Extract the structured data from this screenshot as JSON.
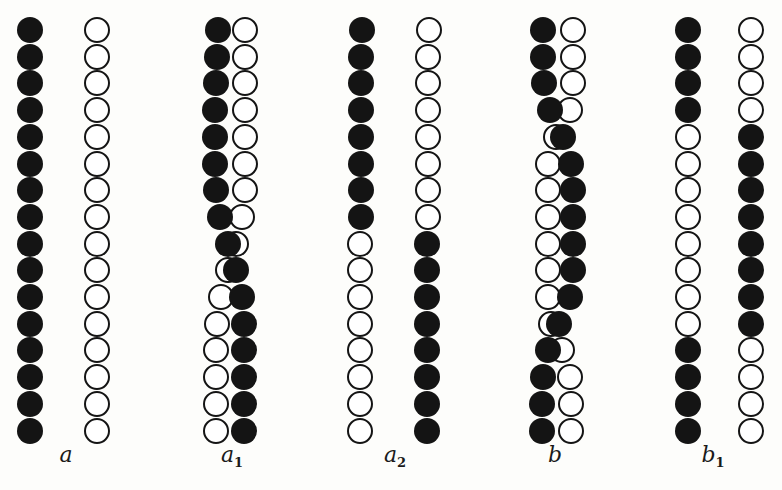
{
  "figure": {
    "background": "#fdfdfb",
    "ink": "#141414",
    "bead_radius": 13,
    "row_y_start": 30,
    "row_pitch": 26.7,
    "rows": 16,
    "label_y": 452,
    "panels": [
      {
        "id": "a",
        "label": "a",
        "subscript": "",
        "label_x": 66,
        "strands": [
          {
            "name": "left-strand",
            "x": [
              30,
              30,
              30,
              30,
              30,
              30,
              30,
              30,
              30,
              30,
              30,
              30,
              30,
              30,
              30,
              30
            ],
            "fill": [
              "F",
              "F",
              "F",
              "F",
              "F",
              "F",
              "F",
              "F",
              "F",
              "F",
              "F",
              "F",
              "F",
              "F",
              "F",
              "F"
            ]
          },
          {
            "name": "right-strand",
            "x": [
              97,
              97,
              97,
              97,
              97,
              97,
              97,
              97,
              97,
              97,
              97,
              97,
              97,
              97,
              97,
              97
            ],
            "fill": [
              "H",
              "H",
              "H",
              "H",
              "H",
              "H",
              "H",
              "H",
              "H",
              "H",
              "H",
              "H",
              "H",
              "H",
              "H",
              "H"
            ]
          }
        ]
      },
      {
        "id": "a1",
        "label": "a",
        "subscript": "1",
        "label_x": 232,
        "strands": [
          {
            "name": "hollow-strand",
            "x": [
              245,
              245,
              245,
              245,
              245,
              245,
              245,
              242,
              236,
              228,
              221,
              217,
              216,
              216,
              216,
              216
            ],
            "fill": [
              "H",
              "H",
              "H",
              "H",
              "H",
              "H",
              "H",
              "H",
              "H",
              "H",
              "H",
              "H",
              "H",
              "H",
              "H",
              "H"
            ]
          },
          {
            "name": "filled-strand",
            "x": [
              218,
              217,
              216,
              215,
              215,
              215,
              216,
              220,
              228,
              236,
              242,
              244,
              244,
              244,
              244,
              244
            ],
            "fill": [
              "F",
              "F",
              "F",
              "F",
              "F",
              "F",
              "F",
              "F",
              "F",
              "F",
              "F",
              "F",
              "F",
              "F",
              "F",
              "F"
            ]
          }
        ]
      },
      {
        "id": "a2",
        "label": "a",
        "subscript": "2",
        "label_x": 395,
        "strands": [
          {
            "name": "left-strand",
            "x": [
              362,
              361,
              361,
              361,
              361,
              361,
              361,
              361,
              360,
              360,
              360,
              360,
              360,
              360,
              360,
              360
            ],
            "fill": [
              "F",
              "F",
              "F",
              "F",
              "F",
              "F",
              "F",
              "F",
              "H",
              "H",
              "H",
              "H",
              "H",
              "H",
              "H",
              "H"
            ]
          },
          {
            "name": "right-strand",
            "x": [
              429,
              428,
              428,
              428,
              428,
              428,
              428,
              428,
              427,
              427,
              427,
              427,
              427,
              427,
              427,
              427
            ],
            "fill": [
              "H",
              "H",
              "H",
              "H",
              "H",
              "H",
              "H",
              "H",
              "F",
              "F",
              "F",
              "F",
              "F",
              "F",
              "F",
              "F"
            ]
          }
        ]
      },
      {
        "id": "b",
        "label": "b",
        "subscript": "",
        "label_x": 555,
        "strands": [
          {
            "name": "hollow-strand",
            "x": [
              573,
              573,
              573,
              570,
              556,
              548,
              548,
              548,
              548,
              548,
              548,
              551,
              562,
              570,
              571,
              571
            ],
            "fill": [
              "H",
              "H",
              "H",
              "H",
              "H",
              "H",
              "H",
              "H",
              "H",
              "H",
              "H",
              "H",
              "H",
              "H",
              "H",
              "H"
            ]
          },
          {
            "name": "filled-strand",
            "x": [
              543,
              543,
              544,
              550,
              563,
              571,
              573,
              573,
              573,
              573,
              570,
              559,
              548,
              543,
              542,
              542
            ],
            "fill": [
              "F",
              "F",
              "F",
              "F",
              "F",
              "F",
              "F",
              "F",
              "F",
              "F",
              "F",
              "F",
              "F",
              "F",
              "F",
              "F"
            ]
          }
        ]
      },
      {
        "id": "b1",
        "label": "b",
        "subscript": "1",
        "label_x": 713,
        "strands": [
          {
            "name": "left-strand",
            "x": [
              688,
              688,
              688,
              688,
              688,
              688,
              688,
              688,
              688,
              688,
              688,
              688,
              688,
              688,
              688,
              688
            ],
            "fill": [
              "F",
              "F",
              "F",
              "F",
              "H",
              "H",
              "H",
              "H",
              "H",
              "H",
              "H",
              "H",
              "F",
              "F",
              "F",
              "F"
            ]
          },
          {
            "name": "right-strand",
            "x": [
              751,
              751,
              751,
              751,
              751,
              751,
              751,
              751,
              751,
              751,
              751,
              751,
              751,
              751,
              751,
              751
            ],
            "fill": [
              "H",
              "H",
              "H",
              "H",
              "F",
              "F",
              "F",
              "F",
              "F",
              "F",
              "F",
              "F",
              "H",
              "H",
              "H",
              "H"
            ]
          }
        ]
      }
    ]
  }
}
